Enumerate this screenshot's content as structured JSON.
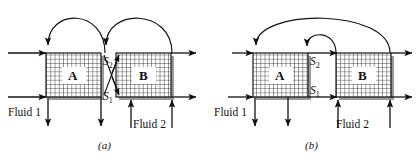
{
  "figure": {
    "type": "process-flow-diagram",
    "panels": [
      {
        "id": "a",
        "caption": "(a)",
        "blocks": [
          {
            "label": "A",
            "name": "block-a"
          },
          {
            "label": "B",
            "name": "block-b"
          }
        ],
        "streams": [
          {
            "label": "S",
            "sub": "2",
            "name": "stream-s2"
          },
          {
            "label": "S",
            "sub": "1",
            "name": "stream-s1"
          }
        ],
        "inlets": [
          {
            "label": "Fluid 1",
            "name": "fluid-1-label"
          },
          {
            "label": "Fluid 2",
            "name": "fluid-2-label"
          }
        ]
      },
      {
        "id": "b",
        "caption": "(b)",
        "blocks": [
          {
            "label": "A",
            "name": "block-a"
          },
          {
            "label": "B",
            "name": "block-b"
          }
        ],
        "streams": [
          {
            "label": "S",
            "sub": "2",
            "name": "stream-s2"
          },
          {
            "label": "S",
            "sub": "1",
            "name": "stream-s1"
          }
        ],
        "inlets": [
          {
            "label": "Fluid 1",
            "name": "fluid-1-label"
          },
          {
            "label": "Fluid 2",
            "name": "fluid-2-label"
          }
        ]
      }
    ],
    "colors": {
      "line": "#111111",
      "grid": "#3a3a3a",
      "shadow": "#9a9a9a",
      "background": "#ffffff"
    }
  }
}
